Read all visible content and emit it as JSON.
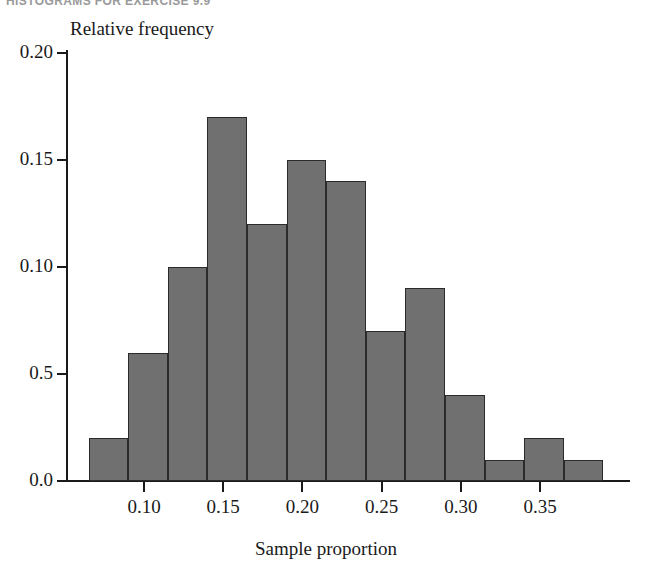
{
  "page": {
    "running_header": "HISTOGRAMS FOR EXERCISE 9.9"
  },
  "chart_data": {
    "type": "bar",
    "title": "",
    "xlabel": "Sample proportion",
    "ylabel": "Relative frequency",
    "xlim": [
      0.06,
      0.395
    ],
    "ylim": [
      0.0,
      0.205
    ],
    "grid": false,
    "legend": "none",
    "bin_width": 0.025,
    "bin_starts": [
      0.065,
      0.09,
      0.115,
      0.14,
      0.165,
      0.19,
      0.215,
      0.24,
      0.265,
      0.29,
      0.315,
      0.34,
      0.365
    ],
    "categories": [
      "0.065-0.090",
      "0.090-0.115",
      "0.115-0.140",
      "0.140-0.165",
      "0.165-0.190",
      "0.190-0.215",
      "0.215-0.240",
      "0.240-0.265",
      "0.265-0.290",
      "0.290-0.315",
      "0.315-0.340",
      "0.340-0.365",
      "0.365-0.390"
    ],
    "values": [
      0.02,
      0.06,
      0.1,
      0.17,
      0.12,
      0.15,
      0.14,
      0.07,
      0.09,
      0.04,
      0.01,
      0.02,
      0.01
    ],
    "xticks": [
      0.1,
      0.15,
      0.2,
      0.25,
      0.3,
      0.35
    ],
    "xticklabels": [
      "0.10",
      "0.15",
      "0.20",
      "0.25",
      "0.30",
      "0.35"
    ],
    "yticks": [
      0.2,
      0.15,
      0.1,
      0.05,
      0.0
    ],
    "yticklabels": [
      "0.20",
      "0.15",
      "0.10",
      "0.5",
      "0.0"
    ],
    "bar_color": "#707070",
    "bar_edge_color": "#2b2b2b",
    "axis_color": "#1a1a1a",
    "background_color": "#ffffff"
  }
}
